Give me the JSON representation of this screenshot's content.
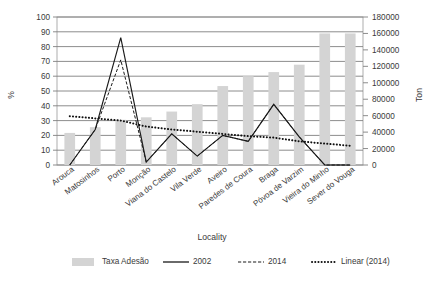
{
  "chart_data": {
    "type": "bar",
    "title": "",
    "xlabel": "Locality",
    "ylabel": "%",
    "ylabel_secondary": "Ton",
    "categories": [
      "Arouca",
      "Matosinhos",
      "Porto",
      "Monção",
      "Viana do Castelo",
      "Vila Verde",
      "Aveiro",
      "Paredes de Coura",
      "Braga",
      "Póvoa de Varzim",
      "Vieira do Minho",
      "Sever do Vouga"
    ],
    "ylim": [
      0,
      100
    ],
    "yticks": [
      0,
      10,
      20,
      30,
      40,
      50,
      60,
      70,
      80,
      90,
      100
    ],
    "ylim_secondary": [
      0,
      180000
    ],
    "yticks_secondary": [
      0,
      20000,
      40000,
      60000,
      80000,
      100000,
      120000,
      140000,
      160000,
      180000
    ],
    "grid": true,
    "legend_position": "bottom",
    "series": [
      {
        "name": "Taxa Adesão",
        "type": "bar",
        "axis": "secondary",
        "values": [
          39000,
          46000,
          55000,
          58000,
          65000,
          74000,
          96000,
          108000,
          113000,
          122000,
          160000,
          160000
        ]
      },
      {
        "name": "2002",
        "type": "line",
        "axis": "primary",
        "values": [
          0,
          24,
          86,
          2,
          21,
          6,
          20,
          16,
          41,
          19,
          0,
          0
        ]
      },
      {
        "name": "2014",
        "type": "line",
        "axis": "primary",
        "values": [
          0,
          24,
          71,
          2,
          21,
          6,
          20,
          16,
          41,
          19,
          0,
          0
        ]
      },
      {
        "name": "Linear (2014)",
        "type": "line",
        "axis": "primary",
        "values": [
          33,
          31.5,
          30,
          26,
          24,
          22.5,
          21,
          19.5,
          18.5,
          16,
          14.5,
          13
        ]
      }
    ]
  },
  "axes": {
    "left_title": "%",
    "right_title": "Ton",
    "bottom_title": "Locality"
  },
  "legend": {
    "items": [
      {
        "label": "Taxa Adesão",
        "marker": "bar-swatch"
      },
      {
        "label": "2002",
        "marker": "solid-line"
      },
      {
        "label": "2014",
        "marker": "dashed-line"
      },
      {
        "label": "Linear (2014)",
        "marker": "dotted-line"
      }
    ]
  }
}
